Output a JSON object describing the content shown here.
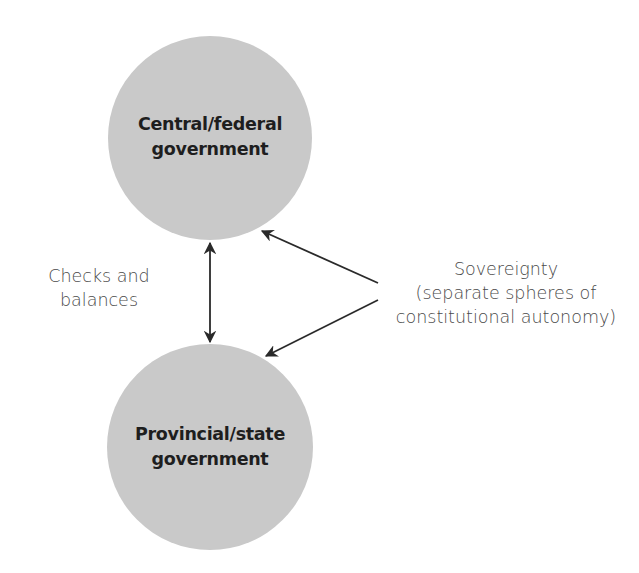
{
  "nodes": {
    "central": {
      "label_line1": "Central/federal",
      "label_line2": "government",
      "fill": "#c9c9c9"
    },
    "provincial": {
      "label_line1": "Provincial/state",
      "label_line2": "government",
      "fill": "#c9c9c9"
    }
  },
  "relations": {
    "checks": {
      "line1": "Checks and",
      "line2": "balances",
      "arrow": "bidirectional"
    },
    "sovereignty": {
      "line1": "Sovereignty",
      "line2": "(separate spheres of",
      "line3": "constitutional autonomy)",
      "arrows_to": [
        "central",
        "provincial"
      ]
    }
  },
  "colors": {
    "circle_fill": "#c9c9c9",
    "arrow": "#2a2a2a",
    "node_text": "#1e1e1e",
    "label_text": "#4a4a4a"
  }
}
